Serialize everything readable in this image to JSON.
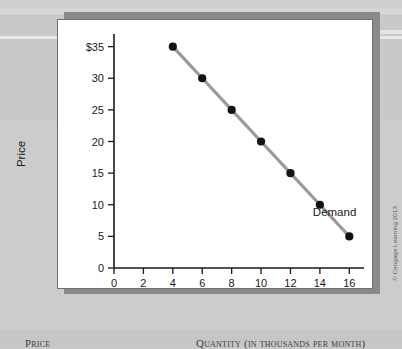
{
  "figure": {
    "credit": "© Cengage Learning 2013"
  },
  "bottom_table_headers": {
    "price": "Price",
    "quantity": "Quantity (in thousands per month)"
  },
  "chart_data": {
    "type": "line",
    "title": "",
    "xlabel": "Quantity (in thousands per month)",
    "ylabel": "Price",
    "xlim": [
      0,
      17
    ],
    "ylim": [
      0,
      37
    ],
    "grid": false,
    "legend_position": "inline-right",
    "x_ticks": [
      0,
      2,
      4,
      6,
      8,
      10,
      12,
      14,
      16
    ],
    "x_tick_labels": [
      "0",
      "2",
      "4",
      "6",
      "8",
      "10",
      "12",
      "14",
      "16"
    ],
    "y_ticks": [
      0,
      5,
      10,
      15,
      20,
      25,
      30,
      35
    ],
    "y_tick_labels": [
      "0",
      "5",
      "10",
      "15",
      "20",
      "25",
      "30",
      "$35"
    ],
    "series": [
      {
        "name": "Demand",
        "color": "#9a9a9a",
        "marker_color": "#121212",
        "x": [
          4,
          6,
          8,
          10,
          12,
          14,
          16
        ],
        "values": [
          35,
          30,
          25,
          20,
          15,
          10,
          5
        ],
        "points": [
          {
            "quantity": 4,
            "price": 35
          },
          {
            "quantity": 6,
            "price": 30
          },
          {
            "quantity": 8,
            "price": 25
          },
          {
            "quantity": 10,
            "price": 20
          },
          {
            "quantity": 12,
            "price": 15
          },
          {
            "quantity": 14,
            "price": 10
          },
          {
            "quantity": 16,
            "price": 5
          }
        ]
      }
    ],
    "annotations": [
      {
        "text": "Demand",
        "x": 15.0,
        "y": 8.2
      }
    ]
  }
}
